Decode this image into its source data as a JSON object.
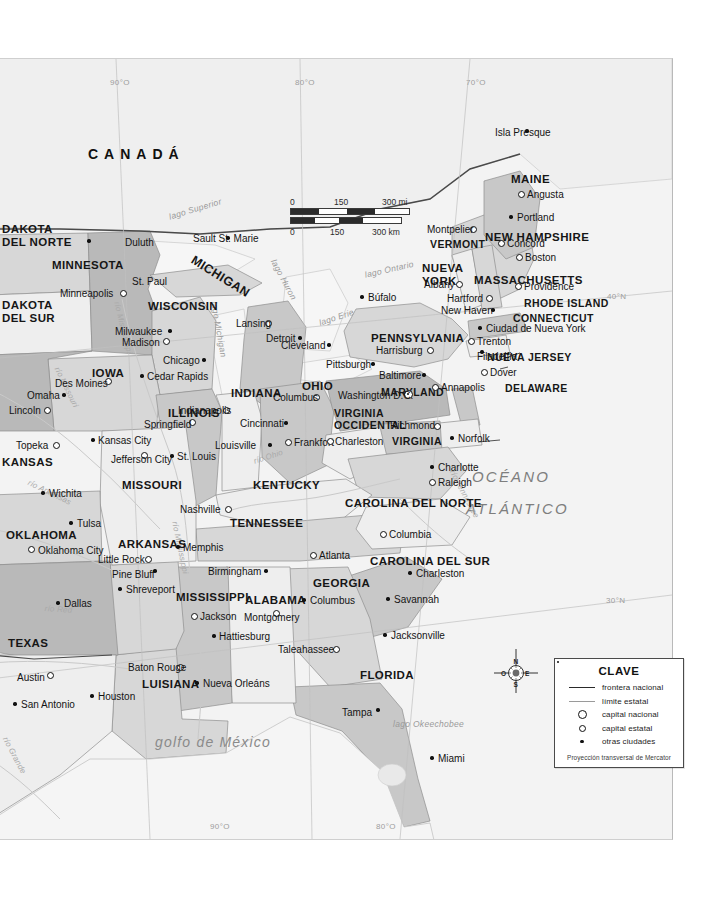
{
  "map": {
    "title_country": "CANADÁ",
    "ocean_label": "OCÉANO ATLÁNTICO",
    "gulf_label": "golfo de México",
    "graticule": [
      {
        "label": "90°O",
        "x": 110,
        "y": 78
      },
      {
        "label": "80°O",
        "x": 295,
        "y": 78
      },
      {
        "label": "70°O",
        "x": 466,
        "y": 78
      },
      {
        "label": "90°O",
        "x": 210,
        "y": 822
      },
      {
        "label": "80°O",
        "x": 376,
        "y": 822
      },
      {
        "label": "40°N",
        "x": 607,
        "y": 292
      },
      {
        "label": "30°N",
        "x": 606,
        "y": 596
      }
    ],
    "lakes": [
      {
        "label": "lago Superior",
        "x": 168,
        "y": 212,
        "rot": -17
      },
      {
        "label": "lago Michigan",
        "x": 218,
        "y": 300,
        "rot": 80
      },
      {
        "label": "lago Huron",
        "x": 277,
        "y": 257,
        "rot": 62
      },
      {
        "label": "lago Erie",
        "x": 318,
        "y": 318,
        "rot": -18
      },
      {
        "label": "lago Ontario",
        "x": 364,
        "y": 270,
        "rot": -13
      },
      {
        "label": "lago Okeechobee",
        "x": 393,
        "y": 719,
        "rot": 0
      }
    ],
    "rivers": [
      {
        "label": "río Mississippi",
        "x": 120,
        "y": 300,
        "rot": 76
      },
      {
        "label": "río Missouri",
        "x": 60,
        "y": 365,
        "rot": 64
      },
      {
        "label": "río Mississippi",
        "x": 178,
        "y": 520,
        "rot": 78
      },
      {
        "label": "río Ohio",
        "x": 253,
        "y": 457,
        "rot": -18
      },
      {
        "label": "río Tennessee",
        "x": 455,
        "y": 468,
        "rot": 62
      },
      {
        "label": "río Arkansas",
        "x": 30,
        "y": 478,
        "rot": 26
      },
      {
        "label": "río Red",
        "x": 45,
        "y": 604,
        "rot": 4
      },
      {
        "label": "río Grande",
        "x": 8,
        "y": 735,
        "rot": 62
      }
    ],
    "states": [
      {
        "name": "DAKOTA DEL NORTE",
        "x": 2,
        "y": 222,
        "size": "s11",
        "lines": [
          "DAKOTA",
          "DEL NORTE"
        ]
      },
      {
        "name": "DAKOTA DEL SUR",
        "x": 2,
        "y": 298,
        "size": "s11",
        "lines": [
          "DAKOTA",
          "DEL SUR"
        ]
      },
      {
        "name": "MINNESOTA",
        "x": 52,
        "y": 258,
        "size": "s11",
        "lines": [
          "MINNESOTA"
        ]
      },
      {
        "name": "WISCONSIN",
        "x": 148,
        "y": 299,
        "size": "s11",
        "lines": [
          "WISCONSIN"
        ]
      },
      {
        "name": "MICHIGAN",
        "x": 196,
        "y": 252,
        "size": "s12",
        "lines": [
          "MICHIGAN"
        ],
        "rot": 32
      },
      {
        "name": "IOWA",
        "x": 92,
        "y": 366,
        "size": "s11",
        "lines": [
          "IOWA"
        ]
      },
      {
        "name": "ILLINOIS",
        "x": 168,
        "y": 406,
        "size": "s11",
        "lines": [
          "ILLINOIS"
        ]
      },
      {
        "name": "INDIANA",
        "x": 231,
        "y": 386,
        "size": "s11",
        "lines": [
          "INDIANA"
        ]
      },
      {
        "name": "OHIO",
        "x": 302,
        "y": 379,
        "size": "s11",
        "lines": [
          "OHIO"
        ]
      },
      {
        "name": "PENNSYLVANIA",
        "x": 371,
        "y": 331,
        "size": "s11",
        "lines": [
          "PENNSYLVANIA"
        ]
      },
      {
        "name": "NUEVA YORK",
        "x": 422,
        "y": 261,
        "size": "s11",
        "lines": [
          "NUEVA",
          "YORK"
        ]
      },
      {
        "name": "VERMONT",
        "x": 430,
        "y": 237,
        "size": "s10",
        "lines": [
          "VERMONT"
        ]
      },
      {
        "name": "NEW HAMPSHIRE",
        "x": 485,
        "y": 230,
        "size": "s11",
        "lines": [
          "NEW HAMPSHIRE"
        ]
      },
      {
        "name": "MAINE",
        "x": 511,
        "y": 172,
        "size": "s11",
        "lines": [
          "MAINE"
        ]
      },
      {
        "name": "MASSACHUSETTS",
        "x": 474,
        "y": 273,
        "size": "s11",
        "lines": [
          "MASSACHUSETTS"
        ]
      },
      {
        "name": "RHODE ISLAND",
        "x": 524,
        "y": 296,
        "size": "s10",
        "lines": [
          "RHODE ISLAND"
        ]
      },
      {
        "name": "CONNECTICUT",
        "x": 513,
        "y": 311,
        "size": "s10",
        "lines": [
          "CONNECTICUT"
        ]
      },
      {
        "name": "NUEVA JERSEY",
        "x": 487,
        "y": 350,
        "size": "s10",
        "lines": [
          "NUEVA JERSEY"
        ]
      },
      {
        "name": "DELAWARE",
        "x": 505,
        "y": 381,
        "size": "s10",
        "lines": [
          "DELAWARE"
        ]
      },
      {
        "name": "MARYLAND",
        "x": 381,
        "y": 385,
        "size": "s10",
        "lines": [
          "MARYLAND"
        ]
      },
      {
        "name": "VIRGINIA OCCIDENTAL",
        "x": 334,
        "y": 406,
        "size": "s10",
        "lines": [
          "VIRGINIA",
          "OCCIDENTAL"
        ]
      },
      {
        "name": "VIRGINIA",
        "x": 392,
        "y": 434,
        "size": "s10",
        "lines": [
          "VIRGINIA"
        ]
      },
      {
        "name": "KENTUCKY",
        "x": 253,
        "y": 478,
        "size": "s11",
        "lines": [
          "KENTUCKY"
        ]
      },
      {
        "name": "TENNESSEE",
        "x": 230,
        "y": 516,
        "size": "s11",
        "lines": [
          "TENNESSEE"
        ]
      },
      {
        "name": "CAROLINA DEL NORTE",
        "x": 345,
        "y": 496,
        "size": "s11",
        "lines": [
          "CAROLINA DEL NORTE"
        ]
      },
      {
        "name": "CAROLINA DEL SUR",
        "x": 370,
        "y": 554,
        "size": "s11",
        "lines": [
          "CAROLINA DEL SUR"
        ]
      },
      {
        "name": "GEORGIA",
        "x": 313,
        "y": 576,
        "size": "s11",
        "lines": [
          "GEORGIA"
        ]
      },
      {
        "name": "FLORIDA",
        "x": 360,
        "y": 668,
        "size": "s11",
        "lines": [
          "FLORIDA"
        ]
      },
      {
        "name": "ALABAMA",
        "x": 245,
        "y": 593,
        "size": "s11",
        "lines": [
          "ALABAMA"
        ]
      },
      {
        "name": "MISSISSIPPI",
        "x": 176,
        "y": 590,
        "size": "s11",
        "lines": [
          "MISSISSIPPI"
        ]
      },
      {
        "name": "LUISIANA",
        "x": 142,
        "y": 677,
        "size": "s11",
        "lines": [
          "LUISIANA"
        ]
      },
      {
        "name": "ARKANSAS",
        "x": 118,
        "y": 537,
        "size": "s11",
        "lines": [
          "ARKANSAS"
        ]
      },
      {
        "name": "MISSOURI",
        "x": 122,
        "y": 478,
        "size": "s11",
        "lines": [
          "MISSOURI"
        ]
      },
      {
        "name": "KANSAS",
        "x": 2,
        "y": 455,
        "size": "s11",
        "lines": [
          "KANSAS"
        ]
      },
      {
        "name": "OKLAHOMA",
        "x": 6,
        "y": 528,
        "size": "s11",
        "lines": [
          "OKLAHOMA"
        ]
      },
      {
        "name": "TEXAS",
        "x": 8,
        "y": 636,
        "size": "s11",
        "lines": [
          "TEXAS"
        ]
      }
    ],
    "cities": [
      {
        "name": "Duluth",
        "x": 89,
        "y": 240,
        "dx": 36,
        "dy": 3,
        "type": "city"
      },
      {
        "name": "Minneapolis",
        "x": 123,
        "y": 292,
        "dx": -63,
        "dy": 2,
        "type": "capital_estatal"
      },
      {
        "name": "St. Paul",
        "x": 126,
        "y": 283,
        "dx": 6,
        "dy": -1,
        "type": "none"
      },
      {
        "name": "Sault St. Marie",
        "x": 228,
        "y": 237,
        "dx": -35,
        "dy": 2,
        "type": "city"
      },
      {
        "name": "Milwaukee",
        "x": 170,
        "y": 330,
        "dx": -55,
        "dy": 2,
        "type": "city"
      },
      {
        "name": "Madison",
        "x": 166,
        "y": 340,
        "dx": -44,
        "dy": 3,
        "type": "capital_estatal"
      },
      {
        "name": "Lansing",
        "x": 268,
        "y": 322,
        "dx": -32,
        "dy": 2,
        "type": "capital_estatal"
      },
      {
        "name": "Detroit",
        "x": 300,
        "y": 337,
        "dx": -34,
        "dy": 2,
        "type": "city"
      },
      {
        "name": "Chicago",
        "x": 204,
        "y": 359,
        "dx": -41,
        "dy": 2,
        "type": "city"
      },
      {
        "name": "Cedar Rapids",
        "x": 142,
        "y": 375,
        "dx": 5,
        "dy": 2,
        "type": "city"
      },
      {
        "name": "Des Moines",
        "x": 108,
        "y": 380,
        "dx": -53,
        "dy": 4,
        "type": "capital_estatal"
      },
      {
        "name": "Omaha",
        "x": 64,
        "y": 394,
        "dx": -37,
        "dy": 2,
        "type": "city"
      },
      {
        "name": "Lincoln",
        "x": 47,
        "y": 409,
        "dx": -38,
        "dy": 2,
        "type": "capital_estatal"
      },
      {
        "name": "Indianapolis",
        "x": 226,
        "y": 409,
        "dx": -48,
        "dy": 2,
        "type": "capital_estatal"
      },
      {
        "name": "Columbus",
        "x": 316,
        "y": 396,
        "dx": -43,
        "dy": 2,
        "type": "capital_estatal"
      },
      {
        "name": "Springfield",
        "x": 192,
        "y": 421,
        "dx": -48,
        "dy": 4,
        "type": "capital_estatal"
      },
      {
        "name": "Cincinnati",
        "x": 286,
        "y": 422,
        "dx": -46,
        "dy": 2,
        "type": "city"
      },
      {
        "name": "Topeka",
        "x": 56,
        "y": 444,
        "dx": -40,
        "dy": 2,
        "type": "capital_estatal"
      },
      {
        "name": "Kansas City",
        "x": 93,
        "y": 439,
        "dx": 5,
        "dy": 2,
        "type": "city"
      },
      {
        "name": "Jefferson City",
        "x": 144,
        "y": 454,
        "dx": -33,
        "dy": 6,
        "type": "capital_estatal"
      },
      {
        "name": "St. Louis",
        "x": 172,
        "y": 455,
        "dx": 5,
        "dy": 2,
        "type": "city"
      },
      {
        "name": "Louisville",
        "x": 270,
        "y": 444,
        "dx": -55,
        "dy": 2,
        "type": "city"
      },
      {
        "name": "Frankfort",
        "x": 288,
        "y": 441,
        "dx": 6,
        "dy": 2,
        "type": "capital_estatal"
      },
      {
        "name": "Charleston",
        "x": 330,
        "y": 440,
        "dx": 5,
        "dy": 2,
        "type": "capital_estatal"
      },
      {
        "name": "Richmond",
        "x": 437,
        "y": 425,
        "dx": -47,
        "dy": 1,
        "type": "capital_estatal"
      },
      {
        "name": "Norfolk",
        "x": 452,
        "y": 437,
        "dx": 6,
        "dy": 2,
        "type": "city"
      },
      {
        "name": "Wichita",
        "x": 43,
        "y": 492,
        "dx": 6,
        "dy": 2,
        "type": "city"
      },
      {
        "name": "Tulsa",
        "x": 71,
        "y": 522,
        "dx": 6,
        "dy": 2,
        "type": "city"
      },
      {
        "name": "Oklahoma City",
        "x": 31,
        "y": 548,
        "dx": 7,
        "dy": 3,
        "type": "capital_estatal"
      },
      {
        "name": "Little Rock",
        "x": 148,
        "y": 558,
        "dx": -50,
        "dy": 2,
        "type": "capital_estatal"
      },
      {
        "name": "Pine Bluff",
        "x": 155,
        "y": 570,
        "dx": -43,
        "dy": 5,
        "type": "city"
      },
      {
        "name": "Memphis",
        "x": 178,
        "y": 546,
        "dx": 5,
        "dy": 2,
        "type": "city"
      },
      {
        "name": "Nashville",
        "x": 228,
        "y": 508,
        "dx": -48,
        "dy": 2,
        "type": "capital_estatal"
      },
      {
        "name": "Dallas",
        "x": 58,
        "y": 602,
        "dx": 6,
        "dy": 2,
        "type": "city"
      },
      {
        "name": "Shreveport",
        "x": 120,
        "y": 588,
        "dx": 6,
        "dy": 2,
        "type": "city"
      },
      {
        "name": "Jackson",
        "x": 194,
        "y": 615,
        "dx": 6,
        "dy": 2,
        "type": "capital_estatal"
      },
      {
        "name": "Birmingham",
        "x": 266,
        "y": 570,
        "dx": -58,
        "dy": 2,
        "type": "city"
      },
      {
        "name": "Montgomery",
        "x": 276,
        "y": 612,
        "dx": -32,
        "dy": 6,
        "type": "capital_estatal"
      },
      {
        "name": "Hattiesburg",
        "x": 214,
        "y": 635,
        "dx": 5,
        "dy": 2,
        "type": "city"
      },
      {
        "name": "Baton Rouge",
        "x": 180,
        "y": 666,
        "dx": -52,
        "dy": 2,
        "type": "capital_estatal"
      },
      {
        "name": "Nueva Orleáns",
        "x": 197,
        "y": 682,
        "dx": 6,
        "dy": 2,
        "type": "city"
      },
      {
        "name": "Houston",
        "x": 92,
        "y": 695,
        "dx": 6,
        "dy": 2,
        "type": "city"
      },
      {
        "name": "Austin",
        "x": 50,
        "y": 674,
        "dx": -33,
        "dy": 4,
        "type": "capital_estatal"
      },
      {
        "name": "San Antonio",
        "x": 15,
        "y": 703,
        "dx": 6,
        "dy": 2,
        "type": "city"
      },
      {
        "name": "Atlanta",
        "x": 313,
        "y": 554,
        "dx": 6,
        "dy": 2,
        "type": "capital_estatal"
      },
      {
        "name": "Columbus",
        "x": 304,
        "y": 599,
        "dx": 6,
        "dy": 2,
        "type": "city"
      },
      {
        "name": "Columbia",
        "x": 383,
        "y": 533,
        "dx": 6,
        "dy": 2,
        "type": "capital_estatal"
      },
      {
        "name": "Charleston",
        "x": 410,
        "y": 572,
        "dx": 6,
        "dy": 2,
        "type": "city"
      },
      {
        "name": "Savannah",
        "x": 388,
        "y": 598,
        "dx": 6,
        "dy": 2,
        "type": "city"
      },
      {
        "name": "Taleahassee",
        "x": 336,
        "y": 648,
        "dx": -58,
        "dy": 2,
        "type": "capital_estatal"
      },
      {
        "name": "Jacksonville",
        "x": 385,
        "y": 634,
        "dx": 6,
        "dy": 2,
        "type": "city"
      },
      {
        "name": "Tampa",
        "x": 378,
        "y": 709,
        "dx": -36,
        "dy": 4,
        "type": "city"
      },
      {
        "name": "Miami",
        "x": 432,
        "y": 757,
        "dx": 6,
        "dy": 2,
        "type": "city"
      },
      {
        "name": "Raleigh",
        "x": 432,
        "y": 481,
        "dx": 6,
        "dy": 2,
        "type": "capital_estatal"
      },
      {
        "name": "Charlotte",
        "x": 432,
        "y": 466,
        "dx": 6,
        "dy": 2,
        "type": "city"
      },
      {
        "name": "Isla Presque",
        "x": 527,
        "y": 130,
        "dx": -32,
        "dy": 3,
        "type": "city"
      },
      {
        "name": "Angusta",
        "x": 521,
        "y": 193,
        "dx": 6,
        "dy": 2,
        "type": "capital_estatal"
      },
      {
        "name": "Portland",
        "x": 511,
        "y": 216,
        "dx": 6,
        "dy": 2,
        "type": "city"
      },
      {
        "name": "Montpelier",
        "x": 473,
        "y": 228,
        "dx": -46,
        "dy": 2,
        "type": "capital_estatal"
      },
      {
        "name": "Concord",
        "x": 501,
        "y": 242,
        "dx": 6,
        "dy": 2,
        "type": "capital_estatal"
      },
      {
        "name": "Boston",
        "x": 519,
        "y": 256,
        "dx": 6,
        "dy": 2,
        "type": "capital_estatal"
      },
      {
        "name": "Providence",
        "x": 518,
        "y": 285,
        "dx": 6,
        "dy": 2,
        "type": "capital_estatal"
      },
      {
        "name": "Hartford",
        "x": 489,
        "y": 297,
        "dx": -42,
        "dy": 2,
        "type": "capital_estatal"
      },
      {
        "name": "New Haven",
        "x": 493,
        "y": 309,
        "dx": -52,
        "dy": 2,
        "type": "city"
      },
      {
        "name": "Albany",
        "x": 459,
        "y": 283,
        "dx": -35,
        "dy": 2,
        "type": "capital_estatal"
      },
      {
        "name": "Búfalo",
        "x": 362,
        "y": 296,
        "dx": 6,
        "dy": 2,
        "type": "city"
      },
      {
        "name": "Ciudad de Nueva York",
        "x": 480,
        "y": 327,
        "dx": 6,
        "dy": 2,
        "type": "city"
      },
      {
        "name": "Trenton",
        "x": 471,
        "y": 340,
        "dx": 6,
        "dy": 2,
        "type": "capital_estatal"
      },
      {
        "name": "Filadelfia",
        "x": 482,
        "y": 351,
        "dx": -5,
        "dy": 6,
        "type": "city"
      },
      {
        "name": "Dover",
        "x": 484,
        "y": 371,
        "dx": 6,
        "dy": 2,
        "type": "capital_estatal"
      },
      {
        "name": "Annapolis",
        "x": 435,
        "y": 386,
        "dx": 6,
        "dy": 2,
        "type": "capital_estatal"
      },
      {
        "name": "Baltimore",
        "x": 424,
        "y": 374,
        "dx": -45,
        "dy": 2,
        "type": "city"
      },
      {
        "name": "Washington D.C.",
        "x": 408,
        "y": 393,
        "dx": -70,
        "dy": 3,
        "type": "capital_nacional"
      },
      {
        "name": "Harrisburg",
        "x": 430,
        "y": 349,
        "dx": -54,
        "dy": 2,
        "type": "capital_estatal"
      },
      {
        "name": "Pittsburgh",
        "x": 373,
        "y": 363,
        "dx": -47,
        "dy": 2,
        "type": "city"
      },
      {
        "name": "Cleveland",
        "x": 329,
        "y": 344,
        "dx": -48,
        "dy": 2,
        "type": "city"
      }
    ]
  },
  "scalebar": {
    "miles": {
      "ticks": [
        "0",
        "150",
        "300 mi"
      ]
    },
    "km": {
      "ticks": [
        "0",
        "150",
        "300 km"
      ]
    }
  },
  "compass": {
    "north": "N",
    "south": "S",
    "east": "E",
    "west": "O"
  },
  "legend": {
    "title": "CLAVE",
    "items": [
      {
        "symbol": "line-national",
        "label": "frontera nacional"
      },
      {
        "symbol": "line-state",
        "label": "límite estatal"
      },
      {
        "symbol": "capital-nacional-icon",
        "label": "capital nacional"
      },
      {
        "symbol": "capital-estatal-icon",
        "label": "capital estatal"
      },
      {
        "symbol": "city-dot-icon",
        "label": "otras ciudades"
      }
    ],
    "projection": "Proyección transversal de Mercator"
  },
  "colors": {
    "land_light": "#eeeeee",
    "land_mid": "#d7d7d7",
    "land_dark": "#b9b9b9",
    "water": "#f4f4f4",
    "border": "#555555"
  }
}
